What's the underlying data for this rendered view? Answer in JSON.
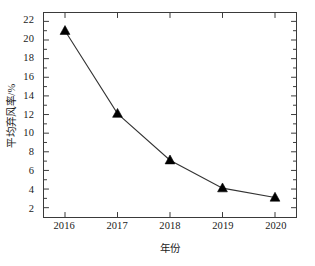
{
  "chart_data": {
    "type": "line",
    "title": "",
    "subtitle": "",
    "xlabel": "年份",
    "ylabel": "平均弃风率/%",
    "categories": [
      "2016",
      "2017",
      "2018",
      "2019",
      "2020"
    ],
    "x": [
      2016,
      2017,
      2018,
      2019,
      2020
    ],
    "values": [
      21.0,
      12.1,
      7.1,
      4.1,
      3.1
    ],
    "series": [
      {
        "name": "平均弃风率",
        "values": [
          21.0,
          12.1,
          7.1,
          4.1,
          3.1
        ],
        "marker": "triangle-up",
        "marker_color": "#000000",
        "line_color": "#333333"
      }
    ],
    "xlim": [
      2015.6,
      2020.4
    ],
    "ylim": [
      1.0,
      22.9
    ],
    "y_ticks": [
      2,
      4,
      6,
      8,
      10,
      12,
      14,
      16,
      18,
      20,
      22
    ],
    "y_tick_labels": [
      "2",
      "4",
      "6",
      "8",
      "10",
      "12",
      "14",
      "16",
      "18",
      "20",
      "22"
    ],
    "y_minor_ticks": [
      3,
      5,
      7,
      9,
      11,
      13,
      15,
      17,
      19,
      21
    ],
    "x_ticks": [
      2016,
      2017,
      2018,
      2019,
      2020
    ],
    "x_tick_labels": [
      "2016",
      "2017",
      "2018",
      "2019",
      "2020"
    ],
    "grid": false,
    "legend": "none",
    "frame": "box",
    "tick_direction": "in",
    "annotations": []
  },
  "axes": {
    "y_title": "平均弃风率/%",
    "x_title": "年份"
  },
  "colors": {
    "background": "#ffffff",
    "frame": "#3a3a3a",
    "line": "#333333",
    "marker": "#000000",
    "text": "#1a1a1a"
  }
}
